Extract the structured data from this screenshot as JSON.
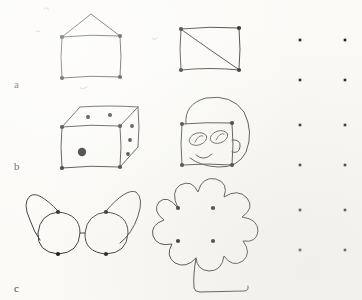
{
  "figure": {
    "medium": "hand-drawn pen sketch on paper",
    "background_color": "#fbfaf7",
    "ink_color": "#2b2b2b",
    "dot_color": "#111111",
    "width": 362,
    "height": 300
  },
  "row_labels": [
    {
      "text": "a",
      "x": 14,
      "y": 78
    },
    {
      "text": "b",
      "x": 14,
      "y": 163
    },
    {
      "text": "c",
      "x": 14,
      "y": 288
    }
  ],
  "base_motif": {
    "name": "four-dot square",
    "description": "Each drawing is elaborated from a square of four dots"
  },
  "drawings": [
    {
      "id": "house",
      "label": "house",
      "row": "a",
      "column": "left",
      "square": {
        "left": 62,
        "top": 36,
        "right": 120,
        "bottom": 78
      },
      "features": [
        "square body",
        "triangular roof",
        "roof apex"
      ],
      "vertex_dots": 4
    },
    {
      "id": "square-diagonal",
      "label": "square with diagonal",
      "row": "a",
      "column": "right",
      "square": {
        "left": 181,
        "top": 28,
        "right": 239,
        "bottom": 70
      },
      "features": [
        "square outline",
        "diagonal from top-left to bottom-right"
      ],
      "vertex_dots": 4
    },
    {
      "id": "die-cube",
      "label": "die (cube)",
      "row": "b",
      "column": "left",
      "square": {
        "left": 62,
        "top": 126,
        "right": 120,
        "bottom": 168
      },
      "features": [
        "front face",
        "top face in perspective",
        "right face in perspective"
      ],
      "pips": {
        "front": 1,
        "top": 2,
        "right": 3
      },
      "vertex_dots": 4
    },
    {
      "id": "face",
      "label": "face",
      "row": "b",
      "column": "right",
      "square": {
        "left": 182,
        "top": 123,
        "right": 232,
        "bottom": 165
      },
      "features": [
        "round head outline",
        "two eyes",
        "smile",
        "ear"
      ],
      "vertex_dots": 4
    },
    {
      "id": "eyeglasses",
      "label": "eyeglasses",
      "row": "c",
      "column": "left",
      "square": {
        "left": 58,
        "top": 212,
        "right": 106,
        "bottom": 254
      },
      "features": [
        "left lens",
        "right lens",
        "bridge",
        "left temple arm",
        "right temple arm"
      ],
      "vertex_dots": 4
    },
    {
      "id": "flower",
      "label": "flower",
      "row": "c",
      "column": "right",
      "square": {
        "left": 178,
        "top": 208,
        "right": 213,
        "bottom": 241
      },
      "features": [
        "scalloped petals",
        "stem",
        "hooked stem base"
      ],
      "petal_count": 9,
      "vertex_dots": 4
    }
  ],
  "dot_grid": {
    "label": "blank response grid",
    "columns": 2,
    "rows": 6,
    "column_x": [
      300,
      345
    ],
    "row_y": [
      40,
      80,
      125,
      165,
      210,
      250
    ],
    "dot_size": 2.6
  }
}
